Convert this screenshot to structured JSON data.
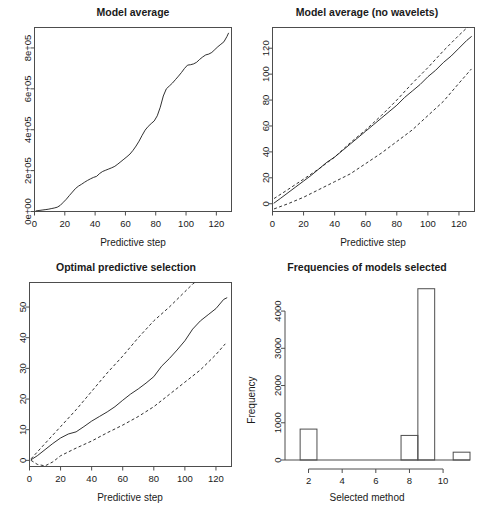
{
  "figure": {
    "background": "#ffffff",
    "line_color": "#1a1a1a",
    "axis_color": "#4d4d4d",
    "layout": "2x2 grid of R base-graphics panels"
  },
  "chart_data": [
    {
      "id": "model-average",
      "panel": "top-left",
      "type": "line",
      "title": "Model average",
      "xlabel": "Predictive step",
      "ylabel": "",
      "xlim": [
        0,
        130
      ],
      "ylim": [
        0,
        900000
      ],
      "grid": false,
      "legend": "none",
      "xticks": [
        0,
        20,
        40,
        60,
        80,
        100,
        120
      ],
      "xticklabels": [
        "0",
        "20",
        "40",
        "60",
        "80",
        "100",
        "120"
      ],
      "yticks": [
        0,
        200000,
        400000,
        600000,
        800000
      ],
      "yticklabels": [
        "0e+00",
        "2e+05",
        "4e+05",
        "6e+05",
        "8e+05"
      ],
      "series": [
        {
          "name": "cumulative predictive loss",
          "style": "solid",
          "x": [
            1,
            3,
            5,
            7,
            9,
            11,
            13,
            15,
            17,
            19,
            21,
            23,
            25,
            27,
            29,
            31,
            33,
            35,
            37,
            39,
            41,
            43,
            45,
            47,
            49,
            51,
            53,
            55,
            57,
            59,
            61,
            63,
            65,
            67,
            69,
            71,
            73,
            75,
            77,
            79,
            81,
            83,
            85,
            87,
            89,
            91,
            93,
            95,
            97,
            99,
            101,
            103,
            105,
            107,
            109,
            111,
            113,
            115,
            117,
            119,
            121,
            123,
            125,
            127,
            128
          ],
          "y": [
            3000,
            5000,
            7000,
            9000,
            11000,
            14000,
            17000,
            21000,
            30000,
            45000,
            60000,
            78000,
            95000,
            112000,
            124000,
            133000,
            143000,
            152000,
            160000,
            167000,
            172000,
            186000,
            196000,
            202000,
            208000,
            214000,
            221000,
            232000,
            244000,
            256000,
            268000,
            281000,
            299000,
            320000,
            344000,
            372000,
            398000,
            416000,
            430000,
            443000,
            468000,
            510000,
            565000,
            600000,
            614000,
            628000,
            645000,
            662000,
            680000,
            700000,
            716000,
            718000,
            722000,
            730000,
            744000,
            756000,
            766000,
            770000,
            778000,
            792000,
            806000,
            818000,
            830000,
            856000,
            872000
          ]
        }
      ]
    },
    {
      "id": "model-average-no-wavelets",
      "panel": "top-right",
      "type": "line",
      "title": "Model average (no wavelets)",
      "xlabel": "Predictive step",
      "ylabel": "",
      "xlim": [
        0,
        130
      ],
      "ylim": [
        -6,
        136
      ],
      "grid": false,
      "legend": "none",
      "xticks": [
        0,
        20,
        40,
        60,
        80,
        100,
        120
      ],
      "xticklabels": [
        "0",
        "20",
        "40",
        "60",
        "80",
        "100",
        "120"
      ],
      "yticks": [
        0,
        20,
        40,
        60,
        80,
        100,
        120
      ],
      "yticklabels": [
        "0",
        "20",
        "40",
        "60",
        "80",
        "100",
        "120"
      ],
      "series": [
        {
          "name": "upper band",
          "style": "dashed",
          "x": [
            1,
            10,
            20,
            30,
            40,
            50,
            60,
            70,
            80,
            90,
            100,
            110,
            120,
            128
          ],
          "y": [
            4,
            11,
            19,
            27,
            36,
            47,
            57,
            68,
            80,
            93,
            105,
            118,
            130,
            139
          ]
        },
        {
          "name": "mean",
          "style": "solid",
          "x": [
            1,
            5,
            10,
            15,
            20,
            25,
            30,
            35,
            40,
            45,
            50,
            55,
            60,
            65,
            70,
            75,
            80,
            85,
            90,
            95,
            100,
            105,
            110,
            115,
            120,
            125,
            128
          ],
          "y": [
            0.5,
            4,
            8.5,
            13,
            17.5,
            22,
            27,
            32,
            36,
            41,
            46,
            51,
            56,
            61,
            66,
            71,
            76,
            82,
            87,
            92,
            98,
            103,
            109,
            114,
            120,
            126,
            129
          ]
        },
        {
          "name": "lower band",
          "style": "dashed",
          "x": [
            1,
            10,
            20,
            30,
            40,
            50,
            60,
            70,
            80,
            90,
            100,
            110,
            120,
            128
          ],
          "y": [
            -4,
            0,
            5,
            11,
            17,
            23,
            31,
            39,
            48,
            57,
            68,
            79,
            93,
            104
          ]
        }
      ]
    },
    {
      "id": "optimal-predictive-selection",
      "panel": "bottom-left",
      "type": "line",
      "title": "Optimal predictive selection",
      "xlabel": "Predictive step",
      "ylabel": "",
      "xlim": [
        0,
        130
      ],
      "ylim": [
        -2,
        58
      ],
      "grid": false,
      "legend": "none",
      "xticks": [
        0,
        20,
        40,
        60,
        80,
        100,
        120
      ],
      "xticklabels": [
        "0",
        "20",
        "40",
        "60",
        "80",
        "100",
        "120"
      ],
      "yticks": [
        0,
        10,
        20,
        30,
        40,
        50
      ],
      "yticklabels": [
        "0",
        "10",
        "20",
        "30",
        "40",
        "50"
      ],
      "series": [
        {
          "name": "upper band",
          "style": "dashed",
          "x": [
            1,
            10,
            20,
            30,
            40,
            50,
            60,
            70,
            80,
            90,
            100,
            105,
            112
          ],
          "y": [
            0.5,
            5.5,
            11,
            16.5,
            22.5,
            28.5,
            34,
            40,
            45.5,
            50,
            55,
            57.5,
            60
          ]
        },
        {
          "name": "mean",
          "style": "solid",
          "x": [
            1,
            5,
            10,
            15,
            20,
            25,
            30,
            35,
            40,
            45,
            50,
            55,
            60,
            65,
            70,
            75,
            80,
            85,
            90,
            95,
            100,
            105,
            110,
            115,
            120,
            125,
            127
          ],
          "y": [
            0.2,
            1.5,
            3.5,
            5.5,
            7.3,
            8.6,
            9.3,
            11,
            12.8,
            14.3,
            15.8,
            17.5,
            19.6,
            21.6,
            23.3,
            25.2,
            27.3,
            30.7,
            33.2,
            36,
            39,
            42.8,
            45.5,
            47.5,
            49.5,
            52.5,
            53
          ]
        },
        {
          "name": "lower band",
          "style": "dashed",
          "x": [
            1,
            5,
            10,
            15,
            20,
            30,
            40,
            50,
            60,
            70,
            80,
            90,
            100,
            110,
            120,
            126
          ],
          "y": [
            0,
            -1.3,
            -1.8,
            -0.5,
            1.5,
            4,
            6.3,
            9,
            11.5,
            14.3,
            17.5,
            21.5,
            25.5,
            29.5,
            34.5,
            38
          ]
        }
      ]
    },
    {
      "id": "frequencies-of-models-selected",
      "panel": "bottom-right",
      "type": "bar",
      "title": "Frequencies of models selected",
      "xlabel": "Selected method",
      "ylabel": "Frequency",
      "xlim": [
        0.6,
        11.6
      ],
      "ylim": [
        0,
        4700
      ],
      "grid": false,
      "legend": "none",
      "xticks": [
        2,
        4,
        6,
        8,
        10
      ],
      "xticklabels": [
        "2",
        "4",
        "6",
        "8",
        "10"
      ],
      "yticks": [
        0,
        1000,
        2000,
        3000,
        4000
      ],
      "yticklabels": [
        "0",
        "1000",
        "2000",
        "3000",
        "4000"
      ],
      "bin_width": 1,
      "categories": [
        1.5,
        2.5,
        3.5,
        4.5,
        5.5,
        6.5,
        7.5,
        8.5,
        9.5,
        10.5,
        11.5
      ],
      "bin_starts": [
        1.5,
        2.5,
        3.5,
        4.5,
        5.5,
        6.5,
        7.5,
        8.5,
        9.5,
        10.5,
        11.0
      ],
      "values": [
        830,
        0,
        0,
        0,
        0,
        0,
        660,
        4600,
        0,
        0,
        210
      ],
      "bars": [
        {
          "start": 1.5,
          "end": 2.5,
          "value": 830
        },
        {
          "start": 7.5,
          "end": 8.5,
          "value": 660
        },
        {
          "start": 8.5,
          "end": 9.5,
          "value": 4600
        },
        {
          "start": 10.6,
          "end": 11.6,
          "value": 210
        }
      ]
    }
  ]
}
